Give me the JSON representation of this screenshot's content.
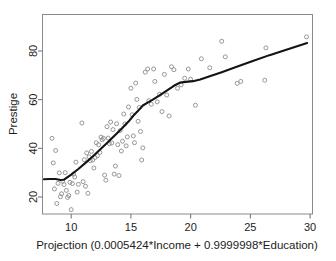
{
  "chart_data": {
    "type": "scatter",
    "title": "",
    "xlabel": "Projection (0.0005424*Income + 0.9999998*Education)",
    "ylabel": "Prestige",
    "xlim": [
      7.6,
      30.2
    ],
    "ylim": [
      13.0,
      95.0
    ],
    "xticks": [
      10,
      15,
      20,
      25,
      30
    ],
    "xtick_labels": [
      "10",
      "15",
      "20",
      "25",
      "30"
    ],
    "yticks": [
      20,
      40,
      60,
      80
    ],
    "ytick_labels": [
      "20",
      "40",
      "60",
      "80"
    ],
    "grid": false,
    "legend": "none",
    "point_marker": "open-circle",
    "point_color": "#8c8c8c",
    "curve_color": "#141414",
    "frame_color": "#8a8a8a",
    "series": [
      {
        "name": "Prestige vs Projection",
        "type": "scatter",
        "points": [
          [
            8.4,
            44.1
          ],
          [
            8.5,
            34.0
          ],
          [
            8.6,
            23.3
          ],
          [
            8.7,
            39.1
          ],
          [
            8.8,
            17.3
          ],
          [
            8.9,
            25.6
          ],
          [
            9.0,
            29.9
          ],
          [
            9.1,
            20.1
          ],
          [
            9.2,
            21.3
          ],
          [
            9.3,
            26.5
          ],
          [
            9.4,
            25.1
          ],
          [
            9.5,
            30.0
          ],
          [
            9.6,
            22.7
          ],
          [
            9.7,
            19.8
          ],
          [
            9.8,
            20.6
          ],
          [
            9.9,
            26.0
          ],
          [
            10.0,
            14.8
          ],
          [
            10.1,
            25.5
          ],
          [
            10.2,
            29.4
          ],
          [
            10.3,
            28.2
          ],
          [
            10.4,
            34.3
          ],
          [
            10.5,
            22.0
          ],
          [
            10.6,
            25.2
          ],
          [
            10.9,
            50.4
          ],
          [
            11.0,
            26.3
          ],
          [
            11.1,
            35.3
          ],
          [
            11.2,
            24.4
          ],
          [
            11.3,
            38.1
          ],
          [
            11.4,
            21.5
          ],
          [
            11.5,
            36.5
          ],
          [
            11.6,
            34.9
          ],
          [
            11.7,
            38.7
          ],
          [
            11.8,
            35.2
          ],
          [
            11.9,
            31.9
          ],
          [
            12.0,
            36.2
          ],
          [
            12.1,
            42.3
          ],
          [
            12.2,
            37.0
          ],
          [
            12.3,
            41.5
          ],
          [
            12.4,
            38.3
          ],
          [
            12.5,
            44.6
          ],
          [
            12.6,
            43.5
          ],
          [
            12.7,
            44.1
          ],
          [
            12.8,
            29.0
          ],
          [
            12.9,
            26.9
          ],
          [
            13.0,
            48.9
          ],
          [
            13.1,
            44.2
          ],
          [
            13.2,
            41.9
          ],
          [
            13.3,
            50.8
          ],
          [
            13.4,
            42.2
          ],
          [
            13.5,
            47.7
          ],
          [
            13.6,
            29.4
          ],
          [
            13.7,
            32.7
          ],
          [
            13.8,
            50.1
          ],
          [
            13.9,
            41.5
          ],
          [
            14.0,
            28.8
          ],
          [
            14.1,
            47.3
          ],
          [
            14.2,
            38.9
          ],
          [
            14.3,
            42.9
          ],
          [
            14.4,
            54.1
          ],
          [
            14.5,
            50.0
          ],
          [
            14.6,
            41.0
          ],
          [
            14.7,
            44.7
          ],
          [
            14.8,
            57.0
          ],
          [
            15.0,
            64.7
          ],
          [
            15.1,
            53.8
          ],
          [
            15.2,
            45.1
          ],
          [
            15.3,
            42.3
          ],
          [
            15.4,
            66.8
          ],
          [
            15.5,
            60.1
          ],
          [
            15.6,
            51.1
          ],
          [
            15.7,
            56.8
          ],
          [
            15.8,
            46.9
          ],
          [
            15.9,
            35.2
          ],
          [
            16.0,
            40.2
          ],
          [
            16.2,
            71.3
          ],
          [
            16.4,
            72.6
          ],
          [
            16.5,
            59.6
          ],
          [
            16.7,
            58.1
          ],
          [
            16.9,
            72.6
          ],
          [
            17.0,
            67.5
          ],
          [
            17.2,
            59.1
          ],
          [
            17.4,
            62.2
          ],
          [
            17.6,
            55.1
          ],
          [
            17.8,
            70.4
          ],
          [
            18.0,
            61.9
          ],
          [
            18.2,
            53.3
          ],
          [
            18.4,
            73.5
          ],
          [
            18.6,
            72.3
          ],
          [
            18.9,
            64.7
          ],
          [
            19.2,
            66.1
          ],
          [
            19.5,
            68.8
          ],
          [
            19.8,
            72.6
          ],
          [
            20.0,
            68.4
          ],
          [
            20.4,
            57.7
          ],
          [
            20.9,
            76.8
          ],
          [
            21.6,
            73.1
          ],
          [
            22.6,
            84.0
          ],
          [
            22.9,
            77.6
          ],
          [
            23.9,
            66.7
          ],
          [
            24.2,
            67.5
          ],
          [
            26.2,
            68.0
          ],
          [
            26.3,
            81.3
          ],
          [
            29.7,
            85.8
          ]
        ]
      },
      {
        "name": "lowess-smooth",
        "type": "line",
        "points": [
          [
            7.72,
            27.3
          ],
          [
            8.2,
            27.4
          ],
          [
            8.7,
            27.4
          ],
          [
            9.1,
            27.0
          ],
          [
            9.4,
            27.1
          ],
          [
            10.0,
            29.2
          ],
          [
            10.6,
            31.5
          ],
          [
            11.2,
            34.0
          ],
          [
            11.8,
            36.6
          ],
          [
            12.4,
            39.4
          ],
          [
            13.0,
            42.2
          ],
          [
            13.6,
            45.1
          ],
          [
            14.2,
            47.9
          ],
          [
            14.8,
            51.0
          ],
          [
            15.2,
            53.4
          ],
          [
            15.6,
            55.4
          ],
          [
            16.0,
            57.6
          ],
          [
            16.4,
            58.8
          ],
          [
            16.8,
            59.9
          ],
          [
            17.4,
            61.8
          ],
          [
            18.0,
            63.7
          ],
          [
            18.6,
            65.7
          ],
          [
            19.1,
            67.0
          ],
          [
            19.6,
            67.3
          ],
          [
            20.2,
            67.6
          ],
          [
            20.8,
            68.3
          ],
          [
            21.6,
            69.6
          ],
          [
            22.6,
            71.3
          ],
          [
            23.8,
            73.4
          ],
          [
            25.2,
            75.9
          ],
          [
            26.6,
            78.3
          ],
          [
            28.2,
            80.8
          ],
          [
            29.75,
            83.3
          ]
        ]
      }
    ]
  }
}
